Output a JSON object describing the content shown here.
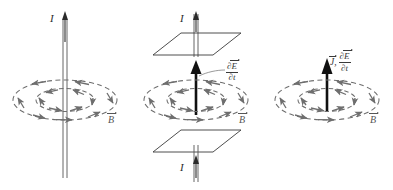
{
  "figure": {
    "background_color": "#ffffff",
    "line_color": "#3a3a3a",
    "field_color": "#6e6e6e",
    "bold_arrow_color": "#111111",
    "panel_count": 3
  },
  "panels": [
    {
      "id": "wire",
      "name": "straight-current-carrying-wire",
      "current_label": "I",
      "field_label": "B",
      "field_label_vector": true,
      "elements": [
        "vertical-wire",
        "current-arrow",
        "outer-field-loop",
        "inner-field-loop",
        "field-label"
      ],
      "wire_style": "double-line",
      "field_loop_count": 2,
      "field_loop_style": "dashed",
      "field_direction": "counterclockwise-viewed-from-above"
    },
    {
      "id": "capacitor",
      "name": "parallel-plate-capacitor-displacement-current",
      "current_label_top": "I",
      "current_label_bottom": "I",
      "displacement_label_numerator": "E",
      "displacement_label_denominator": "t",
      "displacement_partial": "∂",
      "field_label": "B",
      "field_label_vector": true,
      "elements": [
        "top-plate",
        "bottom-plate",
        "top-lead-wire",
        "bottom-lead-wire",
        "displacement-current-arrow",
        "outer-field-loop",
        "inner-field-loop",
        "leader-line",
        "field-label"
      ],
      "plate_count": 2,
      "field_loop_count": 2,
      "field_loop_style": "dashed"
    },
    {
      "id": "combined",
      "name": "current-density-and-displacement-current",
      "current_density_label": "J",
      "current_density_vector": true,
      "separator": ",",
      "displacement_label_numerator": "E",
      "displacement_label_denominator": "t",
      "displacement_partial": "∂",
      "field_label": "B",
      "field_label_vector": true,
      "elements": [
        "source-arrow",
        "outer-field-loop",
        "inner-field-loop",
        "field-label"
      ],
      "field_loop_count": 2,
      "field_loop_style": "dashed"
    }
  ]
}
